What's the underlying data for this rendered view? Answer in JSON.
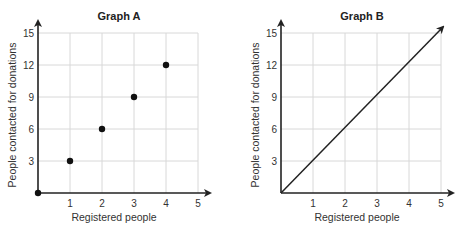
{
  "chart_data": [
    {
      "type": "scatter",
      "title": "Graph A",
      "xlabel": "Registered people",
      "ylabel": "People contacted for donations",
      "xlim": [
        0,
        5
      ],
      "ylim": [
        0,
        15
      ],
      "xticks": [
        "1",
        "2",
        "3",
        "4",
        "5"
      ],
      "yticks": [
        "3",
        "6",
        "9",
        "12",
        "15"
      ],
      "grid": true,
      "points": [
        {
          "x": 0,
          "y": 0
        },
        {
          "x": 1,
          "y": 3
        },
        {
          "x": 2,
          "y": 6
        },
        {
          "x": 3,
          "y": 9
        },
        {
          "x": 4,
          "y": 12
        }
      ]
    },
    {
      "type": "line",
      "title": "Graph B",
      "xlabel": "Registered people",
      "ylabel": "People contacted for donations",
      "xlim": [
        0,
        5
      ],
      "ylim": [
        0,
        15
      ],
      "xticks": [
        "1",
        "2",
        "3",
        "4",
        "5"
      ],
      "yticks": [
        "3",
        "6",
        "9",
        "12",
        "15"
      ],
      "grid": true,
      "line": {
        "from": {
          "x": 0,
          "y": 0
        },
        "to": {
          "x": 5,
          "y": 15
        },
        "arrow": true
      }
    }
  ]
}
